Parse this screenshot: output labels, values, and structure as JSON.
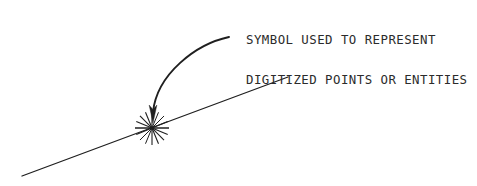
{
  "figure": {
    "background_color": "#ffffff",
    "ink_color": "#2b2b2b",
    "line_color": "#1f1f1f"
  },
  "annotation": {
    "line1": "SYMBOL USED TO REPRESENT",
    "line2": "DIGITIZED POINTS OR ENTITIES",
    "x": 246,
    "y": 7,
    "font_size_px": 12.4,
    "color": "#2b2b2b"
  },
  "leader": {
    "name": "curved-leader-arrow",
    "start_x": 229,
    "start_y": 37,
    "end_x": 153,
    "end_y": 121,
    "control1_x": 196,
    "control1_y": 44,
    "control2_x": 157,
    "control2_y": 74,
    "stroke_width": 1.9,
    "color": "#1f1f1f",
    "arrowhead": "down"
  },
  "baseline": {
    "name": "diagonal-feature-line",
    "x1": 22,
    "y1": 176,
    "x2": 288,
    "y2": 77,
    "stroke_width": 1.3,
    "color": "#1f1f1f"
  },
  "symbol": {
    "name": "digitized-point-starburst",
    "center_x": 152,
    "center_y": 128,
    "radius": 17,
    "ray_count": 8,
    "ray_angles_deg": [
      0,
      45,
      90,
      135,
      180,
      225,
      270,
      315
    ],
    "stroke_width": 1.2,
    "color": "#1f1f1f"
  }
}
